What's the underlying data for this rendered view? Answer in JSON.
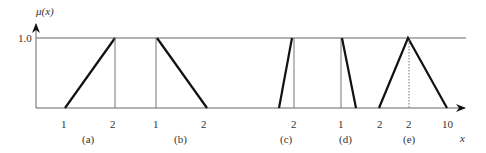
{
  "figure": {
    "y_axis_label": "μ(x)",
    "x_axis_label": "x",
    "y_top_tick": "1.0",
    "colors": {
      "axis": "#666666",
      "line": "#111111",
      "text": "#333333"
    }
  },
  "panels": [
    {
      "id": "a",
      "caption": "(a)",
      "ticks": [
        "1",
        "2"
      ],
      "shape": "ramp-up"
    },
    {
      "id": "b",
      "caption": "(b)",
      "ticks": [
        "1",
        "2"
      ],
      "shape": "ramp-down"
    },
    {
      "id": "c",
      "caption": "(c)",
      "ticks": [
        "2"
      ],
      "shape": "steep-ramp-up"
    },
    {
      "id": "d",
      "caption": "(d)",
      "ticks": [
        "1"
      ],
      "shape": "steep-ramp-down"
    },
    {
      "id": "e",
      "caption": "(e)",
      "ticks": [
        "2",
        "2",
        "10"
      ],
      "shape": "triangle"
    }
  ]
}
